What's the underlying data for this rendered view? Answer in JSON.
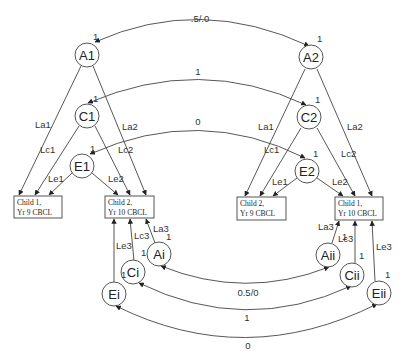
{
  "diagram": {
    "title": "",
    "nodes": {
      "A1": {
        "label": "A1",
        "var": "1"
      },
      "C1": {
        "label": "C1",
        "var": "1"
      },
      "E1": {
        "label": "E1",
        "var": "1"
      },
      "A2": {
        "label": "A2",
        "var": "1"
      },
      "C2": {
        "label": "C2",
        "var": "1"
      },
      "E2": {
        "label": "E2",
        "var": "1"
      },
      "Ai": {
        "label": "Ai",
        "var": "1"
      },
      "Ci": {
        "label": "Ci",
        "var": "1"
      },
      "Ei": {
        "label": "Ei",
        "var": "1"
      },
      "Aii": {
        "label": "Aii",
        "var": "1"
      },
      "Cii": {
        "label": "Cii",
        "var": "1"
      },
      "Eii": {
        "label": "Eii",
        "var": "1"
      }
    },
    "boxes": {
      "b1": {
        "line1": "Child 1,",
        "line2": "Yr 9 CBCL"
      },
      "b2": {
        "line1": "Child 2,",
        "line2": "Yr 10 CBCL"
      },
      "b3": {
        "line1": "Child 2,",
        "line2": "Yr 9 CBCL"
      },
      "b4": {
        "line1": "Child 1,",
        "line2": "Yr 10 CBCL"
      }
    },
    "paths": {
      "La1": "La1",
      "Lc1": "Lc1",
      "Le1": "Le1",
      "La2": "La2",
      "Lc2": "Lc2",
      "Le2": "Le2",
      "La3": "La3",
      "Lc3": "Lc3",
      "Le3": "Le3"
    },
    "correlations": {
      "A_top": ".5/.0",
      "C_top": "1",
      "E_top": "0",
      "A_bottom": "0.5/0",
      "C_bottom": "1",
      "E_bottom": "0"
    }
  }
}
